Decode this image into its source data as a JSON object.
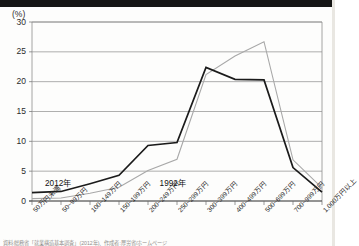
{
  "figure": {
    "unit_label": "(%)",
    "source_note": "資料:総務省「就業構造基本調査」(2012年)、作成者:厚労省/ホームページ"
  },
  "chart_data": {
    "type": "line",
    "title": "",
    "xlabel": "",
    "ylabel": "(%)",
    "ylim": [
      0,
      30
    ],
    "yticks": [
      0,
      5,
      10,
      15,
      20,
      25,
      30
    ],
    "grid": true,
    "legend_position": "inline-annotation",
    "categories": [
      "50万円未満",
      "50~99万円",
      "100~149万円",
      "150~199万円",
      "200~249万円",
      "250~299万円",
      "300~399万円",
      "400~499万円",
      "500~699万円",
      "700~999万円",
      "1,000万円以上"
    ],
    "series": [
      {
        "name": "2012年",
        "color": "#1b1b1b",
        "values": [
          1.4,
          1.6,
          2.9,
          4.3,
          9.3,
          9.8,
          22.4,
          20.4,
          20.3,
          5.6,
          1.5
        ]
      },
      {
        "name": "1992年",
        "color": "#a8a8a8",
        "values": [
          0.4,
          0.5,
          1.3,
          2.3,
          5.1,
          7.0,
          21.2,
          24.3,
          26.7,
          6.9,
          2.2
        ]
      }
    ],
    "annotations": [
      {
        "text": "2012年",
        "category_index": 0.45,
        "value": 3.2
      },
      {
        "text": "1992年",
        "category_index": 4.4,
        "value": 3.2
      }
    ]
  }
}
